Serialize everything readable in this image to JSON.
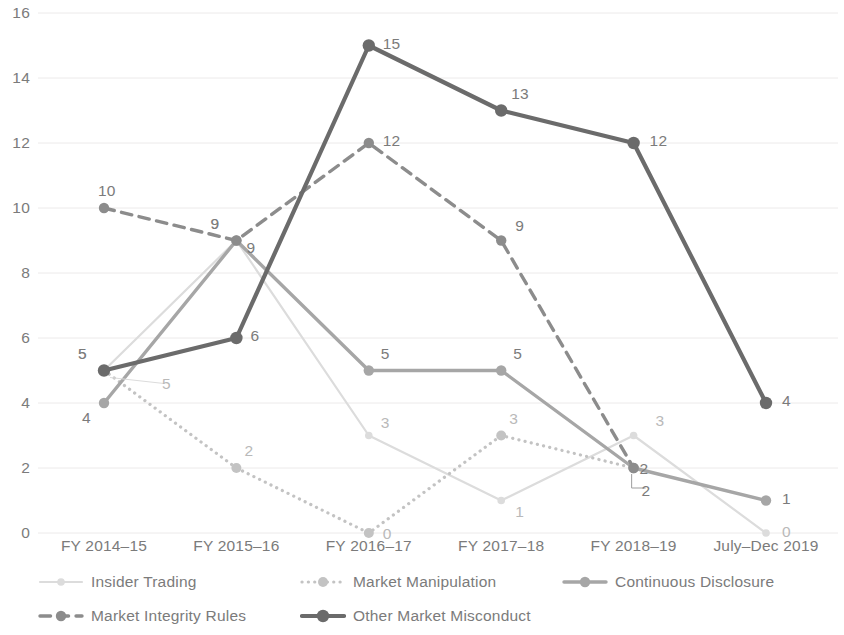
{
  "chart_data": {
    "type": "line",
    "title": "",
    "subtitle": "",
    "xlabel": "",
    "ylabel": "",
    "categories": [
      "FY 2014–15",
      "FY 2015–16",
      "FY 2016–17",
      "FY 2017–18",
      "FY 2018–19",
      "July–Dec 2019"
    ],
    "ylim": [
      0,
      16
    ],
    "ytick_labels": [
      "0",
      "2",
      "4",
      "6",
      "8",
      "10",
      "12",
      "14",
      "16"
    ],
    "ytick_values": [
      0,
      2,
      4,
      6,
      8,
      10,
      12,
      14,
      16
    ],
    "grid": "horizontal",
    "legend_position": "bottom",
    "series": [
      {
        "name": "Insider Trading",
        "color": "#dcdcdc",
        "style": "solid",
        "width": 2.2,
        "values": [
          5,
          9,
          3,
          1,
          3,
          0
        ],
        "labels": [
          "5",
          "9",
          "3",
          "1",
          "3",
          "0"
        ]
      },
      {
        "name": "Market Manipulation",
        "color": "#c3c3c3",
        "style": "dotted",
        "width": 3.2,
        "values": [
          5,
          2,
          0,
          3,
          2,
          null
        ],
        "labels": [
          "5",
          "2",
          "0",
          "3",
          "2",
          ""
        ]
      },
      {
        "name": "Continuous Disclosure",
        "color": "#a6a6a6",
        "style": "solid",
        "width": 3.4,
        "values": [
          4,
          9,
          5,
          5,
          2,
          1
        ],
        "labels": [
          "4",
          "9",
          "5",
          "5",
          "2",
          "1"
        ]
      },
      {
        "name": "Market Integrity Rules",
        "color": "#8c8c8c",
        "style": "dashed",
        "width": 3.4,
        "values": [
          10,
          9,
          12,
          9,
          2,
          null
        ],
        "labels": [
          "10",
          "9",
          "12",
          "9",
          "2",
          ""
        ]
      },
      {
        "name": "Other Market Misconduct",
        "color": "#6b6b6b",
        "style": "solid",
        "width": 4.2,
        "values": [
          5,
          6,
          15,
          13,
          12,
          4
        ],
        "labels": [
          "5",
          "6",
          "15",
          "13",
          "12",
          "4"
        ]
      }
    ]
  },
  "axis": {
    "y_ticks": [
      "16",
      "14",
      "12",
      "10",
      "8",
      "6",
      "4",
      "2",
      "0"
    ],
    "x_ticks": [
      "FY 2014–15",
      "FY 2015–16",
      "FY 2016–17",
      "FY 2017–18",
      "FY 2018–19",
      "July–Dec 2019"
    ]
  },
  "legend": {
    "items": [
      {
        "label": "Insider Trading",
        "color": "#dcdcdc",
        "style": "solid"
      },
      {
        "label": "Market Manipulation",
        "color": "#c3c3c3",
        "style": "dotted"
      },
      {
        "label": "Continuous Disclosure",
        "color": "#a6a6a6",
        "style": "solid"
      },
      {
        "label": "Market Integrity Rules",
        "color": "#8c8c8c",
        "style": "dashed"
      },
      {
        "label": "Other Market Misconduct",
        "color": "#6b6b6b",
        "style": "solid"
      }
    ]
  },
  "colors": {
    "gridline": "#eceaea",
    "text": "#7b7b7b",
    "background": "#ffffff"
  }
}
